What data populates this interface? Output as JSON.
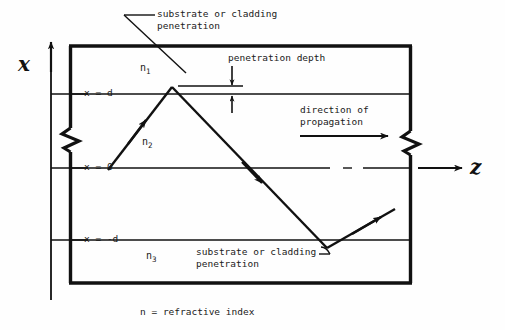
{
  "figure": {
    "type": "optical-waveguide-ray-diagram",
    "caption": "n = refractive index",
    "axes": {
      "vertical": {
        "symbol": "x",
        "direction": "up"
      },
      "horizontal": {
        "symbol": "z",
        "direction": "right"
      }
    },
    "tick_labels": {
      "upper": "x = d",
      "middle": "x = 0",
      "lower": "x = -d"
    },
    "layers": [
      {
        "name": "n1",
        "label": "n",
        "subscript": "1",
        "region": "upper cladding"
      },
      {
        "name": "n2",
        "label": "n",
        "subscript": "2",
        "region": "guiding core"
      },
      {
        "name": "n3",
        "label": "n",
        "subscript": "3",
        "region": "lower substrate"
      }
    ],
    "annotations": {
      "top_callout_line1": "substrate or cladding",
      "top_callout_line2": "penetration",
      "penetration_depth": "penetration depth",
      "direction_line1": "direction of",
      "direction_line2": "propagation",
      "bottom_callout_line1": "substrate or cladding",
      "bottom_callout_line2": "penetration"
    },
    "colors": {
      "ink": "#111111",
      "background": "#fefefe"
    }
  }
}
